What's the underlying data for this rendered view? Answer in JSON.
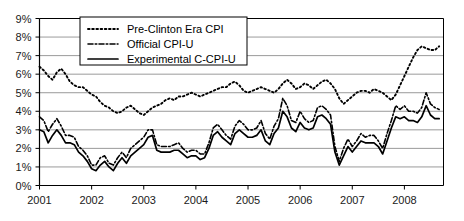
{
  "chart_data": {
    "type": "line",
    "title": "",
    "xlabel": "",
    "ylabel": "",
    "xlim": [
      2001.0,
      2008.75
    ],
    "ylim": [
      0,
      9
    ],
    "grid": true,
    "y_tick_labels": [
      "0%",
      "1%",
      "2%",
      "3%",
      "4%",
      "5%",
      "6%",
      "7%",
      "8%",
      "9%"
    ],
    "y_tick_values": [
      0,
      1,
      2,
      3,
      4,
      5,
      6,
      7,
      8,
      9
    ],
    "x_tick_labels": [
      "2001",
      "2002",
      "2003",
      "2004",
      "2005",
      "2006",
      "2007",
      "2008"
    ],
    "x_tick_values": [
      2001,
      2002,
      2003,
      2004,
      2005,
      2006,
      2007,
      2008
    ],
    "legend_position": "top-center",
    "series": [
      {
        "name": "Pre-Clinton Era CPI",
        "style": "dotted",
        "x": [
          2001.0,
          2001.083,
          2001.167,
          2001.25,
          2001.333,
          2001.417,
          2001.5,
          2001.583,
          2001.667,
          2001.75,
          2001.833,
          2001.917,
          2002.0,
          2002.083,
          2002.167,
          2002.25,
          2002.333,
          2002.417,
          2002.5,
          2002.583,
          2002.667,
          2002.75,
          2002.833,
          2002.917,
          2003.0,
          2003.083,
          2003.167,
          2003.25,
          2003.333,
          2003.417,
          2003.5,
          2003.583,
          2003.667,
          2003.75,
          2003.833,
          2003.917,
          2004.0,
          2004.083,
          2004.167,
          2004.25,
          2004.333,
          2004.417,
          2004.5,
          2004.583,
          2004.667,
          2004.75,
          2004.833,
          2004.917,
          2005.0,
          2005.083,
          2005.167,
          2005.25,
          2005.333,
          2005.417,
          2005.5,
          2005.583,
          2005.667,
          2005.75,
          2005.833,
          2005.917,
          2006.0,
          2006.083,
          2006.167,
          2006.25,
          2006.333,
          2006.417,
          2006.5,
          2006.583,
          2006.667,
          2006.75,
          2006.833,
          2006.917,
          2007.0,
          2007.083,
          2007.167,
          2007.25,
          2007.333,
          2007.417,
          2007.5,
          2007.583,
          2007.667,
          2007.75,
          2007.833,
          2007.917,
          2008.0,
          2008.083,
          2008.167,
          2008.25,
          2008.333,
          2008.417,
          2008.5,
          2008.583,
          2008.667
        ],
        "values": [
          6.4,
          6.2,
          5.9,
          5.7,
          6.1,
          6.3,
          6.0,
          5.6,
          5.4,
          5.3,
          5.3,
          5.1,
          4.9,
          4.8,
          4.5,
          4.3,
          4.2,
          4.0,
          3.9,
          4.0,
          4.2,
          4.3,
          4.1,
          3.9,
          3.8,
          4.0,
          4.2,
          4.3,
          4.4,
          4.6,
          4.7,
          4.6,
          4.8,
          4.8,
          4.9,
          5.0,
          4.9,
          4.8,
          4.9,
          5.0,
          5.1,
          5.2,
          5.3,
          5.3,
          5.5,
          5.6,
          5.4,
          5.1,
          5.0,
          5.1,
          5.2,
          5.3,
          5.2,
          5.1,
          5.0,
          5.2,
          5.5,
          5.7,
          5.5,
          5.2,
          5.3,
          5.5,
          5.4,
          5.2,
          5.4,
          5.6,
          5.7,
          5.5,
          5.2,
          4.7,
          4.4,
          4.6,
          4.8,
          5.0,
          5.1,
          5.1,
          5.0,
          5.2,
          5.1,
          5.0,
          4.8,
          4.6,
          4.9,
          5.4,
          5.9,
          6.4,
          6.9,
          7.3,
          7.5,
          7.4,
          7.3,
          7.3,
          7.5
        ]
      },
      {
        "name": "Official CPI-U",
        "style": "dash-dot",
        "x": [
          2001.0,
          2001.083,
          2001.167,
          2001.25,
          2001.333,
          2001.417,
          2001.5,
          2001.583,
          2001.667,
          2001.75,
          2001.833,
          2001.917,
          2002.0,
          2002.083,
          2002.167,
          2002.25,
          2002.333,
          2002.417,
          2002.5,
          2002.583,
          2002.667,
          2002.75,
          2002.833,
          2002.917,
          2003.0,
          2003.083,
          2003.167,
          2003.25,
          2003.333,
          2003.417,
          2003.5,
          2003.583,
          2003.667,
          2003.75,
          2003.833,
          2003.917,
          2004.0,
          2004.083,
          2004.167,
          2004.25,
          2004.333,
          2004.417,
          2004.5,
          2004.583,
          2004.667,
          2004.75,
          2004.833,
          2004.917,
          2005.0,
          2005.083,
          2005.167,
          2005.25,
          2005.333,
          2005.417,
          2005.5,
          2005.583,
          2005.667,
          2005.75,
          2005.833,
          2005.917,
          2006.0,
          2006.083,
          2006.167,
          2006.25,
          2006.333,
          2006.417,
          2006.5,
          2006.583,
          2006.667,
          2006.75,
          2006.833,
          2006.917,
          2007.0,
          2007.083,
          2007.167,
          2007.25,
          2007.333,
          2007.417,
          2007.5,
          2007.583,
          2007.667,
          2007.75,
          2007.833,
          2007.917,
          2008.0,
          2008.083,
          2008.167,
          2008.25,
          2008.333,
          2008.417,
          2008.5,
          2008.583,
          2008.667
        ],
        "values": [
          3.7,
          3.5,
          2.9,
          3.3,
          3.6,
          3.2,
          2.7,
          2.7,
          2.6,
          2.1,
          1.9,
          1.6,
          1.1,
          1.1,
          1.5,
          1.6,
          1.2,
          1.1,
          1.5,
          1.8,
          1.5,
          2.0,
          2.2,
          2.4,
          2.6,
          3.0,
          3.0,
          2.2,
          2.1,
          2.1,
          2.1,
          2.2,
          2.3,
          2.0,
          1.8,
          1.9,
          1.9,
          1.7,
          1.7,
          2.3,
          3.1,
          3.3,
          3.0,
          2.7,
          2.5,
          3.2,
          3.5,
          3.3,
          3.0,
          3.0,
          3.1,
          3.5,
          2.8,
          2.5,
          3.2,
          3.6,
          4.7,
          4.3,
          3.5,
          3.4,
          4.0,
          3.6,
          3.4,
          3.5,
          4.2,
          4.3,
          4.1,
          3.8,
          2.1,
          1.3,
          2.0,
          2.5,
          2.1,
          2.4,
          2.8,
          2.6,
          2.7,
          2.7,
          2.4,
          2.0,
          2.8,
          3.5,
          4.3,
          4.1,
          4.3,
          4.0,
          4.0,
          3.9,
          4.2,
          5.0,
          4.4,
          4.2,
          4.1
        ]
      },
      {
        "name": "Experimental C-CPI-U",
        "style": "solid",
        "x": [
          2001.0,
          2001.083,
          2001.167,
          2001.25,
          2001.333,
          2001.417,
          2001.5,
          2001.583,
          2001.667,
          2001.75,
          2001.833,
          2001.917,
          2002.0,
          2002.083,
          2002.167,
          2002.25,
          2002.333,
          2002.417,
          2002.5,
          2002.583,
          2002.667,
          2002.75,
          2002.833,
          2002.917,
          2003.0,
          2003.083,
          2003.167,
          2003.25,
          2003.333,
          2003.417,
          2003.5,
          2003.583,
          2003.667,
          2003.75,
          2003.833,
          2003.917,
          2004.0,
          2004.083,
          2004.167,
          2004.25,
          2004.333,
          2004.417,
          2004.5,
          2004.583,
          2004.667,
          2004.75,
          2004.833,
          2004.917,
          2005.0,
          2005.083,
          2005.167,
          2005.25,
          2005.333,
          2005.417,
          2005.5,
          2005.583,
          2005.667,
          2005.75,
          2005.833,
          2005.917,
          2006.0,
          2006.083,
          2006.167,
          2006.25,
          2006.333,
          2006.417,
          2006.5,
          2006.583,
          2006.667,
          2006.75,
          2006.833,
          2006.917,
          2007.0,
          2007.083,
          2007.167,
          2007.25,
          2007.333,
          2007.417,
          2007.5,
          2007.583,
          2007.667,
          2007.75,
          2007.833,
          2007.917,
          2008.0,
          2008.083,
          2008.167,
          2008.25,
          2008.333,
          2008.417,
          2008.5,
          2008.583,
          2008.667
        ],
        "values": [
          3.0,
          2.9,
          2.3,
          2.7,
          3.0,
          2.7,
          2.3,
          2.3,
          2.2,
          1.8,
          1.6,
          1.3,
          0.9,
          0.8,
          1.1,
          1.3,
          1.0,
          0.8,
          1.2,
          1.5,
          1.2,
          1.6,
          1.8,
          2.0,
          2.2,
          2.6,
          2.7,
          1.9,
          1.8,
          1.8,
          1.8,
          1.9,
          1.9,
          1.7,
          1.5,
          1.6,
          1.6,
          1.4,
          1.5,
          2.0,
          2.7,
          2.9,
          2.6,
          2.4,
          2.2,
          2.8,
          3.0,
          2.8,
          2.6,
          2.6,
          2.7,
          3.0,
          2.4,
          2.2,
          2.8,
          3.1,
          4.0,
          3.7,
          3.1,
          2.9,
          3.4,
          3.1,
          3.0,
          3.1,
          3.7,
          3.8,
          3.6,
          3.3,
          1.8,
          1.1,
          1.6,
          2.1,
          1.8,
          2.1,
          2.4,
          2.3,
          2.3,
          2.3,
          2.1,
          1.7,
          2.4,
          3.1,
          3.7,
          3.6,
          3.7,
          3.5,
          3.5,
          3.4,
          3.7,
          4.3,
          3.8,
          3.6,
          3.6
        ]
      }
    ]
  },
  "legend": {
    "items": [
      {
        "label": "Pre-Clinton Era CPI",
        "style": "dotted"
      },
      {
        "label": "Official CPI-U",
        "style": "dash-dot"
      },
      {
        "label": "Experimental C-CPI-U",
        "style": "solid"
      }
    ]
  },
  "colors": {
    "line": "#000000",
    "grid": "#808080",
    "background": "#ffffff",
    "text": "#1a1a1a"
  }
}
